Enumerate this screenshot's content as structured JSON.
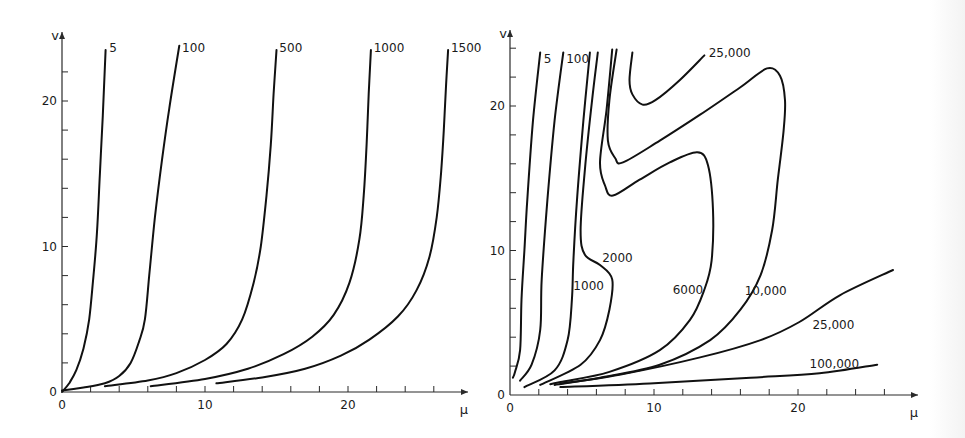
{
  "chart_data": [
    {
      "type": "line",
      "title": "",
      "xlabel": "μ",
      "ylabel": "v",
      "xlim": [
        0,
        28
      ],
      "ylim": [
        0,
        24
      ],
      "xticks_labeled": [
        "0",
        "10",
        "20"
      ],
      "yticks_labeled": [
        "0",
        "10",
        "20"
      ],
      "xtick_values": [
        0,
        10,
        20
      ],
      "ytick_values": [
        0,
        10,
        20
      ],
      "minor_tick_step": 2,
      "grid": false,
      "series": [
        {
          "name": "5",
          "label": "5",
          "points": [
            [
              0,
              0
            ],
            [
              0.5,
              0.6
            ],
            [
              1,
              1.5
            ],
            [
              1.5,
              3
            ],
            [
              1.9,
              5
            ],
            [
              2.2,
              8
            ],
            [
              2.45,
              11
            ],
            [
              2.65,
              15
            ],
            [
              2.85,
              19
            ],
            [
              3.05,
              23.5
            ]
          ]
        },
        {
          "name": "100",
          "label": "100",
          "points": [
            [
              0,
              0.1
            ],
            [
              1.5,
              0.3
            ],
            [
              3,
              0.6
            ],
            [
              4,
              1.1
            ],
            [
              4.8,
              2
            ],
            [
              5.4,
              3.5
            ],
            [
              5.8,
              5
            ],
            [
              6.1,
              8
            ],
            [
              6.5,
              12
            ],
            [
              7,
              16
            ],
            [
              7.5,
              19.5
            ],
            [
              8.2,
              23.8
            ]
          ]
        },
        {
          "name": "500",
          "label": "500",
          "points": [
            [
              3,
              0.4
            ],
            [
              6,
              0.8
            ],
            [
              8,
              1.3
            ],
            [
              10,
              2.2
            ],
            [
              11.5,
              3.3
            ],
            [
              12.6,
              5
            ],
            [
              13.4,
              7.5
            ],
            [
              13.9,
              10
            ],
            [
              14.3,
              13.5
            ],
            [
              14.6,
              17
            ],
            [
              14.8,
              20.5
            ],
            [
              15,
              23.5
            ]
          ]
        },
        {
          "name": "1000",
          "label": "1000",
          "points": [
            [
              6.2,
              0.4
            ],
            [
              10,
              0.9
            ],
            [
              13,
              1.6
            ],
            [
              15.5,
              2.6
            ],
            [
              17.5,
              3.8
            ],
            [
              19,
              5.3
            ],
            [
              20.1,
              7.5
            ],
            [
              20.8,
              10.5
            ],
            [
              21.1,
              13.5
            ],
            [
              21.3,
              17
            ],
            [
              21.45,
              20.5
            ],
            [
              21.6,
              23.5
            ]
          ]
        },
        {
          "name": "1500",
          "label": "1500",
          "points": [
            [
              10.8,
              0.6
            ],
            [
              14,
              1
            ],
            [
              17,
              1.6
            ],
            [
              19.5,
              2.5
            ],
            [
              21.5,
              3.6
            ],
            [
              23.5,
              5.2
            ],
            [
              24.8,
              7
            ],
            [
              25.7,
              9.3
            ],
            [
              26.2,
              12
            ],
            [
              26.5,
              15
            ],
            [
              26.7,
              18
            ],
            [
              26.85,
              21
            ],
            [
              27,
              23.5
            ]
          ]
        }
      ]
    },
    {
      "type": "line",
      "title": "",
      "xlabel": "μ",
      "ylabel": "v",
      "xlim": [
        0,
        28
      ],
      "ylim": [
        0,
        24
      ],
      "xticks_labeled": [
        "0",
        "10",
        "20"
      ],
      "yticks_labeled": [
        "0",
        "10",
        "20"
      ],
      "xtick_values": [
        0,
        10,
        20
      ],
      "ytick_values": [
        0,
        10,
        20
      ],
      "minor_tick_step": 2,
      "grid": false,
      "series": [
        {
          "name": "5",
          "label": "5",
          "points": [
            [
              0.2,
              1.2
            ],
            [
              0.35,
              1.6
            ],
            [
              0.7,
              3.1
            ],
            [
              0.8,
              6.6
            ],
            [
              1.0,
              10
            ],
            [
              1.2,
              13.5
            ],
            [
              1.6,
              19.0
            ],
            [
              2.1,
              23.7
            ]
          ]
        },
        {
          "name": "100",
          "label": "100",
          "points": [
            [
              0.7,
              1.0
            ],
            [
              1.5,
              2.1
            ],
            [
              2.1,
              4.5
            ],
            [
              2.2,
              8.0
            ],
            [
              2.6,
              13.5
            ],
            [
              3.1,
              19.0
            ],
            [
              3.7,
              23.7
            ]
          ]
        },
        {
          "name": "1000",
          "label": "1000",
          "points": [
            [
              1.0,
              0.55
            ],
            [
              3.1,
              1.7
            ],
            [
              4.0,
              3.8
            ],
            [
              4.3,
              6.6
            ],
            [
              4.4,
              9.3
            ],
            [
              4.65,
              13.5
            ],
            [
              5.1,
              19.0
            ],
            [
              5.55,
              23.7
            ]
          ]
        },
        {
          "name": "2000",
          "label": "2000",
          "points": [
            [
              2.1,
              0.7
            ],
            [
              4.9,
              2.1
            ],
            [
              6.25,
              3.8
            ],
            [
              6.9,
              5.9
            ],
            [
              7.1,
              8.0
            ],
            [
              6.25,
              9.0
            ],
            [
              5.2,
              9.7
            ],
            [
              4.9,
              11.4
            ],
            [
              5.2,
              15.6
            ],
            [
              5.7,
              20.4
            ],
            [
              6.1,
              23.7
            ]
          ]
        },
        {
          "name": "6000",
          "label": "6000",
          "points": [
            [
              2.8,
              0.75
            ],
            [
              3.5,
              0.9
            ],
            [
              6.9,
              1.6
            ],
            [
              10.4,
              3.1
            ],
            [
              12.5,
              5.2
            ],
            [
              13.5,
              7.3
            ],
            [
              14.0,
              9.3
            ],
            [
              14.1,
              12.8
            ],
            [
              13.75,
              15.9
            ],
            [
              13.0,
              16.8
            ],
            [
              11.1,
              16.1
            ],
            [
              9.0,
              14.9
            ],
            [
              7.15,
              13.8
            ],
            [
              6.6,
              14.5
            ],
            [
              6.25,
              16.1
            ],
            [
              6.7,
              19.7
            ],
            [
              7.1,
              23.9
            ]
          ]
        },
        {
          "name": "10,000",
          "label": "10,000",
          "points": [
            [
              3.5,
              0.8
            ],
            [
              6.25,
              1.2
            ],
            [
              10.4,
              2.1
            ],
            [
              13.9,
              3.8
            ],
            [
              16.0,
              5.9
            ],
            [
              17.4,
              8.3
            ],
            [
              18.2,
              11.4
            ],
            [
              18.6,
              14.9
            ],
            [
              19.0,
              18.3
            ],
            [
              19.1,
              20.4
            ],
            [
              18.75,
              22.1
            ],
            [
              17.85,
              22.6
            ],
            [
              16.0,
              21.3
            ],
            [
              13.2,
              19.4
            ],
            [
              10.4,
              17.6
            ],
            [
              7.85,
              16.1
            ],
            [
              7.3,
              16.4
            ],
            [
              6.8,
              17.6
            ],
            [
              6.9,
              20.4
            ],
            [
              7.4,
              23.9
            ]
          ]
        },
        {
          "name": "25,000 (upper)",
          "label": "25,000",
          "points": [
            [
              8.5,
              23.7
            ],
            [
              8.3,
              21.8
            ],
            [
              8.5,
              20.8
            ],
            [
              9.2,
              20.1
            ],
            [
              10.1,
              20.4
            ],
            [
              11.8,
              21.8
            ],
            [
              13.5,
              23.5
            ]
          ]
        },
        {
          "name": "25,000 (lower)",
          "label": "25,000",
          "points": [
            [
              3.1,
              0.7
            ],
            [
              7.6,
              1.4
            ],
            [
              13.2,
              2.6
            ],
            [
              17.4,
              3.8
            ],
            [
              20.1,
              5.05
            ],
            [
              22.9,
              6.9
            ],
            [
              26.6,
              8.65
            ]
          ]
        },
        {
          "name": "100,000",
          "label": "100,000",
          "points": [
            [
              3.5,
              0.55
            ],
            [
              9.7,
              0.8
            ],
            [
              16.7,
              1.2
            ],
            [
              21.5,
              1.5
            ],
            [
              25.5,
              2.1
            ]
          ]
        }
      ]
    }
  ],
  "labels": {
    "left": {
      "y_axis": "v",
      "x_axis": "μ",
      "x_ticks": [
        "0",
        "10",
        "20"
      ],
      "y_ticks": [
        "0",
        "10",
        "20"
      ],
      "curves": [
        "5",
        "100",
        "500",
        "1000",
        "1500"
      ]
    },
    "right": {
      "y_axis": "v",
      "x_axis": "μ",
      "x_ticks": [
        "0",
        "10",
        "20"
      ],
      "y_ticks": [
        "0",
        "10",
        "20"
      ],
      "curves": [
        "5",
        "100",
        "1000",
        "2000",
        "6000",
        "10,000",
        "25,000",
        "25,000",
        "100,000"
      ]
    }
  }
}
